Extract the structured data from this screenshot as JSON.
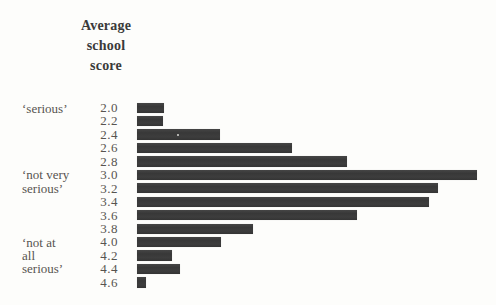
{
  "header": {
    "line1": "Average",
    "line2": "school",
    "line3": "score"
  },
  "category_labels": [
    {
      "text": "‘serious’",
      "aligned_with_score": "2.0"
    },
    {
      "text": "‘not very",
      "aligned_with_score": "3.0"
    },
    {
      "text": "serious’",
      "aligned_with_score": "3.2"
    },
    {
      "text": "‘not at",
      "aligned_with_score": "4.0"
    },
    {
      "text": "all",
      "aligned_with_score": "4.2"
    },
    {
      "text": "serious’",
      "aligned_with_score": "4.4"
    }
  ],
  "chart_data": {
    "type": "bar",
    "orientation": "horizontal",
    "title": "Average school score",
    "ylabel": "Average school score",
    "xlabel": "",
    "categories": [
      "2.0",
      "2.2",
      "2.4",
      "2.6",
      "2.8",
      "3.0",
      "3.2",
      "3.4",
      "3.6",
      "3.8",
      "4.0",
      "4.2",
      "4.4",
      "4.6"
    ],
    "values": [
      27,
      26,
      83,
      155,
      210,
      340,
      301,
      292,
      220,
      116,
      84,
      35,
      43,
      9
    ],
    "value_note": "relative bar lengths (pixels); the figure shows no numeric frequency axis",
    "max_value": 340,
    "group_labels": [
      {
        "label": "‘serious’",
        "at_scores": "2.0"
      },
      {
        "label": "‘not very serious’",
        "at_scores": "3.0–3.2"
      },
      {
        "label": "‘not at all serious’",
        "at_scores": "4.0–4.4"
      }
    ],
    "grid": false,
    "legend": false,
    "bar_color": "#3b3b3b",
    "background": "#fdfdfb"
  }
}
